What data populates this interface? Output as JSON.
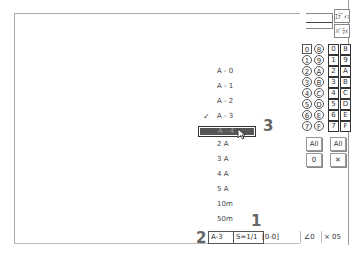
{
  "top_right": {
    "labels": [
      "ｴﾃﾞｨｯﾄ",
      "ﾊﾟﾗﾒ"
    ]
  },
  "circle_buttons": [
    "0",
    "8",
    "1",
    "9",
    "2",
    "A",
    "3",
    "B",
    "4",
    "C",
    "5",
    "D",
    "6",
    "E",
    "7",
    "F"
  ],
  "square_buttons": [
    "0",
    "8",
    "1",
    "9",
    "2",
    "A",
    "3",
    "B",
    "4",
    "C",
    "5",
    "D",
    "6",
    "E",
    "7",
    "F"
  ],
  "side_buttons": {
    "circle_all": "All",
    "circle_zero": "0",
    "square_all": "All",
    "square_clear": "✕"
  },
  "menu": {
    "items": [
      {
        "label": "A - 0",
        "checked": false
      },
      {
        "label": "A - 1",
        "checked": false
      },
      {
        "label": "A - 2",
        "checked": false
      },
      {
        "label": "A - 3",
        "checked": true
      },
      {
        "label": "A - 4",
        "highlighted": true
      },
      {
        "label": "2  A"
      },
      {
        "label": "3  A"
      },
      {
        "label": "4  A"
      },
      {
        "label": "5  A"
      },
      {
        "label": "10m"
      },
      {
        "label": "50m"
      },
      {
        "label": "100m"
      }
    ],
    "check_glyph": "✓"
  },
  "callouts": {
    "one": "1",
    "two": "2",
    "three": "3"
  },
  "status_bar": {
    "range": "A-3",
    "scale": "S=1/1",
    "bracket": "[0-0]",
    "angle": "∠0",
    "mult": "× 05"
  }
}
